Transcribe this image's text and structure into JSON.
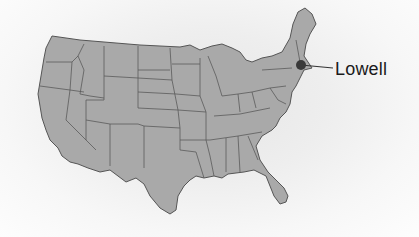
{
  "map": {
    "region": "Contiguous United States",
    "fill_color": "#a9a9a9",
    "border_color": "#555555",
    "marker": {
      "label": "Lowell",
      "color": "#3a3a3a",
      "x": 301,
      "y": 65
    }
  }
}
